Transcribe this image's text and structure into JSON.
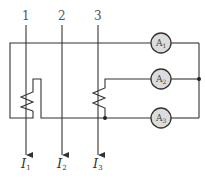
{
  "diagram": {
    "type": "circuit",
    "colors": {
      "wire": "#333333",
      "meter_fill": "#dcdcdc",
      "background": "#ffffff"
    },
    "conductors": [
      {
        "id": "1",
        "label": "1",
        "current_label": "I",
        "current_sub": "1"
      },
      {
        "id": "2",
        "label": "2",
        "current_label": "I",
        "current_sub": "2"
      },
      {
        "id": "3",
        "label": "3",
        "current_label": "I",
        "current_sub": "3"
      }
    ],
    "ammeters": [
      {
        "id": "A1",
        "label": "A",
        "sub": "1"
      },
      {
        "id": "A2",
        "label": "A",
        "sub": "2"
      },
      {
        "id": "A3",
        "label": "A",
        "sub": "3"
      }
    ],
    "resistors": [
      {
        "id": "R1",
        "on_conductor": "1"
      },
      {
        "id": "R3",
        "on_conductor": "3"
      }
    ]
  }
}
